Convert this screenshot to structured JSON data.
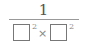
{
  "expression": {
    "numerator": "1",
    "denominator": {
      "term1": {
        "base": "",
        "exponent": "2"
      },
      "operator": "×",
      "term2": {
        "base": "",
        "exponent": "2"
      }
    }
  }
}
